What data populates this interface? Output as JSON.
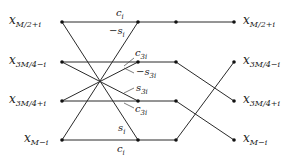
{
  "diagram": {
    "type": "butterfly-flow-graph",
    "inputs": [
      {
        "base": "x",
        "sub": "M/2+i"
      },
      {
        "base": "x",
        "sub": "3M/4−i"
      },
      {
        "base": "x",
        "sub": "3M/4+i"
      },
      {
        "base": "x",
        "sub": "M−i"
      }
    ],
    "outputs": [
      {
        "base": "x",
        "sub": "M/2+i"
      },
      {
        "base": "x",
        "sub": "3M/4−i"
      },
      {
        "base": "x",
        "sub": "3M/4+i"
      },
      {
        "base": "x",
        "sub": "M−i"
      }
    ],
    "coefficients": {
      "top_c": {
        "base": "c",
        "sub": "i"
      },
      "top_s": {
        "base": "−s",
        "sub": "i"
      },
      "r2_c": {
        "base": "c",
        "sub": "3i"
      },
      "r2_s": {
        "base": "−s",
        "sub": "3i"
      },
      "r3_s": {
        "base": "s",
        "sub": "3i"
      },
      "r3_c": {
        "base": "c",
        "sub": "3i"
      },
      "bot_s": {
        "base": "s",
        "sub": "i"
      },
      "bot_c": {
        "base": "c",
        "sub": "i"
      }
    },
    "colors": {
      "line": "#2a2a2a",
      "node": "#111111",
      "background": "#ffffff"
    }
  }
}
